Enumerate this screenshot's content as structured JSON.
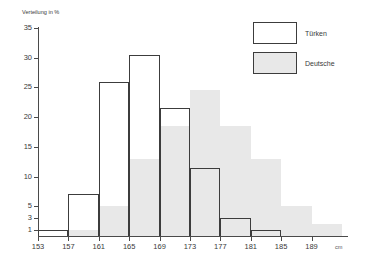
{
  "chart_data": {
    "type": "bar",
    "title": "",
    "subtitle": "",
    "ylabel": "Verteilung in %",
    "xlabel": "",
    "x_unit": "cm",
    "grid": false,
    "legend_position": "top-right",
    "x_tick_labels": [
      "153",
      "157",
      "161",
      "165",
      "169",
      "173",
      "177",
      "181",
      "185",
      "189"
    ],
    "y_tick_labels": [
      "35",
      "30",
      "25",
      "20",
      "15",
      "10",
      "5",
      "3",
      "1"
    ],
    "y_tick_values": [
      35,
      30,
      25,
      20,
      15,
      10,
      5,
      3,
      1
    ],
    "ylim": [
      0,
      35
    ],
    "bin_width_cm": 4,
    "bin_starts": [
      153,
      157,
      161,
      165,
      169,
      173,
      177,
      181,
      185,
      189
    ],
    "series": [
      {
        "name": "Türken",
        "color": "#ffffff",
        "edge_color": "#3c3c3c",
        "values": [
          1,
          7,
          26,
          30.5,
          21.5,
          11.5,
          3,
          1,
          0,
          0
        ]
      },
      {
        "name": "Deutsche",
        "color": "#e8e8e8",
        "edge_color": "#e8e8e8",
        "values": [
          0,
          1,
          5,
          13,
          18.5,
          24.5,
          18.5,
          13,
          5,
          2
        ]
      }
    ]
  },
  "legend": {
    "items": [
      {
        "label": "Türken",
        "swatch": "white"
      },
      {
        "label": "Deutsche",
        "swatch": "gray"
      }
    ]
  },
  "axes": {
    "y_title": "Verteilung in %",
    "x_unit": "cm"
  }
}
